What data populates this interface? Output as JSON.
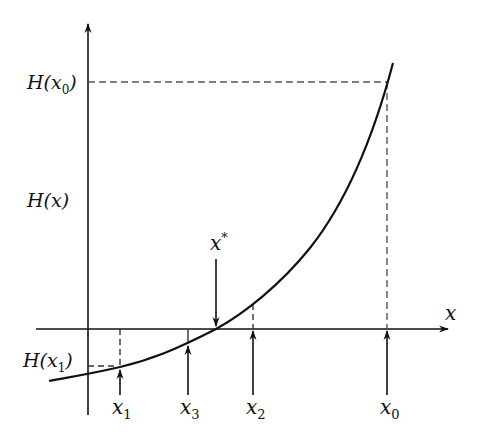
{
  "diagram": {
    "type": "function-iteration-plot",
    "colors": {
      "ink": "#111111",
      "dash": "#555555",
      "background": "#ffffff"
    },
    "axes": {
      "x_label": "x",
      "y_label": "H(x)"
    },
    "y_labels": {
      "h_x0": {
        "main": "H(x",
        "sub": "0",
        "close": ")"
      },
      "h_x1": {
        "main": "H(x",
        "sub": "1",
        "close": ")"
      },
      "h_x": "H(x)"
    },
    "x_markers": [
      {
        "id": "x1",
        "main": "x",
        "sub": "1"
      },
      {
        "id": "x3",
        "main": "x",
        "sub": "3"
      },
      {
        "id": "x2",
        "main": "x",
        "sub": "2"
      },
      {
        "id": "x0",
        "main": "x",
        "sub": "0"
      }
    ],
    "root_marker": {
      "main": "x",
      "sup": "*"
    }
  }
}
